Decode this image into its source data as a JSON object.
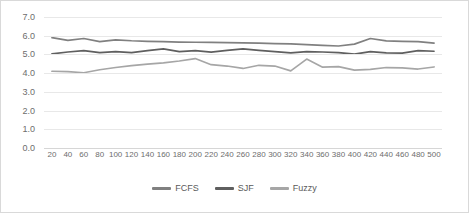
{
  "chart_data": {
    "type": "line",
    "title": "",
    "xlabel": "",
    "ylabel": "",
    "ylim": [
      0.0,
      7.0
    ],
    "ytick_labels": [
      "7.0",
      "6.0",
      "5.0",
      "4.0",
      "3.0",
      "2.0",
      "1.0",
      "0.0"
    ],
    "ytick_values": [
      7.0,
      6.0,
      5.0,
      4.0,
      3.0,
      2.0,
      1.0,
      0.0
    ],
    "grid": true,
    "legend_position": "bottom",
    "categories": [
      "20",
      "40",
      "60",
      "80",
      "100",
      "120",
      "140",
      "160",
      "180",
      "200",
      "220",
      "240",
      "260",
      "280",
      "300",
      "320",
      "340",
      "360",
      "380",
      "400",
      "420",
      "440",
      "460",
      "480",
      "500"
    ],
    "series": [
      {
        "name": "FCFS",
        "color": "#808080",
        "values": [
          5.9,
          5.75,
          5.85,
          5.68,
          5.78,
          5.73,
          5.7,
          5.68,
          5.66,
          5.65,
          5.64,
          5.63,
          5.62,
          5.6,
          5.58,
          5.56,
          5.52,
          5.48,
          5.45,
          5.55,
          5.85,
          5.72,
          5.7,
          5.68,
          5.6
        ]
      },
      {
        "name": "SJF",
        "color": "#5f5f5f",
        "values": [
          5.03,
          5.13,
          5.2,
          5.1,
          5.15,
          5.1,
          5.2,
          5.3,
          5.15,
          5.2,
          5.12,
          5.22,
          5.3,
          5.22,
          5.15,
          5.08,
          5.15,
          5.13,
          5.1,
          5.02,
          5.15,
          5.08,
          5.07,
          5.2,
          5.17
        ]
      },
      {
        "name": "Fuzzy",
        "color": "#a6a6a6",
        "values": [
          4.1,
          4.08,
          4.02,
          4.18,
          4.3,
          4.4,
          4.48,
          4.55,
          4.65,
          4.78,
          4.45,
          4.38,
          4.25,
          4.42,
          4.38,
          4.12,
          4.75,
          4.32,
          4.35,
          4.16,
          4.2,
          4.3,
          4.28,
          4.22,
          4.33
        ]
      }
    ]
  },
  "legend": {
    "items": [
      {
        "label": "FCFS"
      },
      {
        "label": "SJF"
      },
      {
        "label": "Fuzzy"
      }
    ]
  }
}
